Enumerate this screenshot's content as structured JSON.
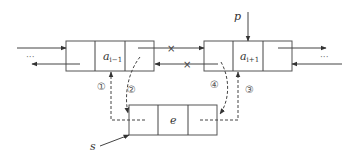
{
  "diagram": {
    "nodes": {
      "left": {
        "value_main": "a",
        "value_sub": "i−1"
      },
      "right": {
        "value_main": "a",
        "value_sub": "i+1"
      },
      "new": {
        "value": "e"
      }
    },
    "pointers": {
      "p": "p",
      "s": "s"
    },
    "steps": [
      "①",
      "②",
      "③",
      "④"
    ],
    "ellipsis_left": "···",
    "ellipsis_right": "···",
    "cross_mark": "×"
  }
}
